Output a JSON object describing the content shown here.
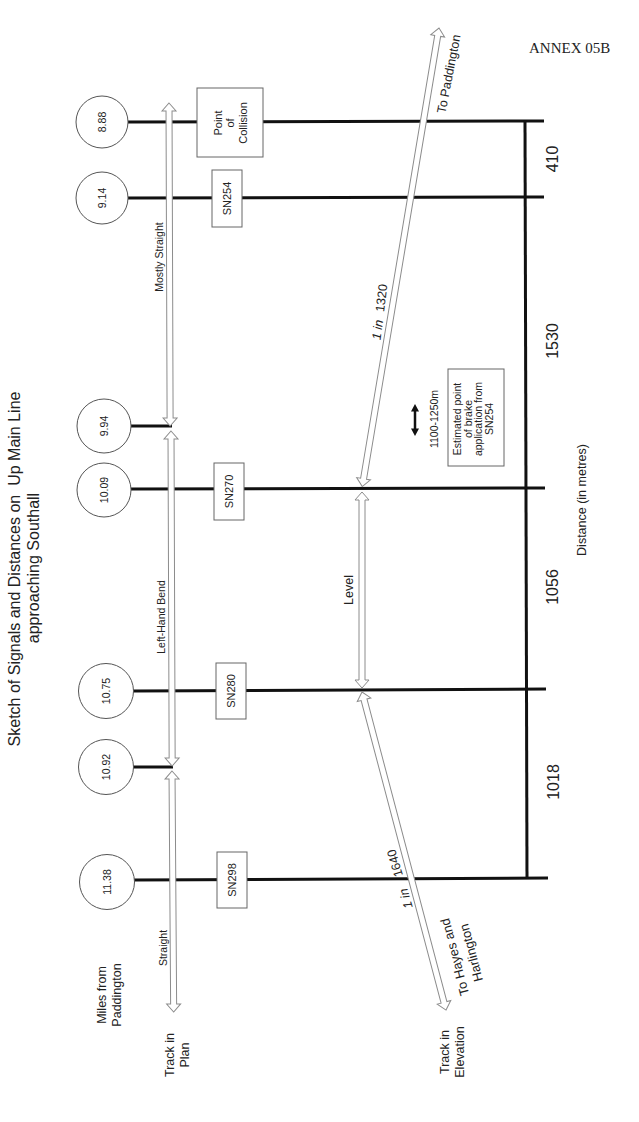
{
  "header": {
    "annex": "ANNEX 05B"
  },
  "title": {
    "line1": "Sketch of Signals and Distances on  Up Main Line",
    "line2": "approaching Southall"
  },
  "row_labels": {
    "miles_from_paddington": [
      "Miles from",
      "Paddington"
    ],
    "track_in_plan": [
      "Track in",
      "Plan"
    ],
    "track_in_elevation": [
      "Track in",
      "Elevation"
    ]
  },
  "signals": [
    {
      "miles": "8.88",
      "label_lines": [
        "Point",
        "of",
        "Collision"
      ]
    },
    {
      "miles": "9.14",
      "signal": "SN254"
    },
    {
      "miles": "9.94"
    },
    {
      "miles": "10.09",
      "signal": "SN270"
    },
    {
      "miles": "10.75",
      "signal": "SN280"
    },
    {
      "miles": "10.92"
    },
    {
      "miles": "11.38",
      "signal": "SN298"
    }
  ],
  "track_plan": [
    {
      "label": "Mostly Straight"
    },
    {
      "label": "Left-Hand Bend"
    },
    {
      "label": "Straight"
    }
  ],
  "track_elevation": [
    {
      "gradient_prefix": "1 in",
      "gradient_value": "1320"
    },
    {
      "label": "Level"
    },
    {
      "gradient_prefix": "1 in",
      "gradient_value": "1640"
    }
  ],
  "directions": {
    "up": "To Paddington",
    "down": [
      "To Hayes and",
      "Harlington"
    ]
  },
  "distances": {
    "axis_label": "Distance (in metres)",
    "segments": [
      "410",
      "1530",
      "1056",
      "1018"
    ]
  },
  "brake_estimate": {
    "range": "1100-1250m",
    "note_lines": [
      "Estimated point",
      "of brake",
      "application from",
      "SN254"
    ]
  },
  "colors": {
    "background": "#ffffff",
    "track_line": "#111111",
    "arrow_outline": "#8c8c8c",
    "text": "#222222"
  }
}
